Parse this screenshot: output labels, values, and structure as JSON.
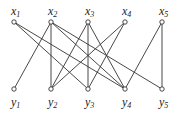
{
  "diagram": {
    "type": "bipartite-graph",
    "top_nodes": [
      {
        "id": "x1",
        "base": "x",
        "sub": "1",
        "x": 14,
        "y": 22
      },
      {
        "id": "x2",
        "base": "x",
        "sub": "2",
        "x": 51,
        "y": 22
      },
      {
        "id": "x3",
        "base": "x",
        "sub": "3",
        "x": 88,
        "y": 22
      },
      {
        "id": "x4",
        "base": "x",
        "sub": "4",
        "x": 125,
        "y": 22
      },
      {
        "id": "x5",
        "base": "x",
        "sub": "5",
        "x": 162,
        "y": 22
      }
    ],
    "bottom_nodes": [
      {
        "id": "y1",
        "base": "y",
        "sub": "1",
        "x": 14,
        "y": 89
      },
      {
        "id": "y2",
        "base": "y",
        "sub": "2",
        "x": 51,
        "y": 89
      },
      {
        "id": "y3",
        "base": "y",
        "sub": "3",
        "x": 88,
        "y": 89
      },
      {
        "id": "y4",
        "base": "y",
        "sub": "4",
        "x": 125,
        "y": 89
      },
      {
        "id": "y5",
        "base": "y",
        "sub": "5",
        "x": 162,
        "y": 89
      }
    ],
    "edges": [
      [
        "x1",
        "y3"
      ],
      [
        "x1",
        "y4"
      ],
      [
        "x2",
        "y1"
      ],
      [
        "x2",
        "y2"
      ],
      [
        "x2",
        "y4"
      ],
      [
        "x2",
        "y5"
      ],
      [
        "x3",
        "y2"
      ],
      [
        "x3",
        "y3"
      ],
      [
        "x3",
        "y4"
      ],
      [
        "x4",
        "y2"
      ],
      [
        "x4",
        "y3"
      ],
      [
        "x5",
        "y4"
      ],
      [
        "x5",
        "y5"
      ]
    ]
  }
}
